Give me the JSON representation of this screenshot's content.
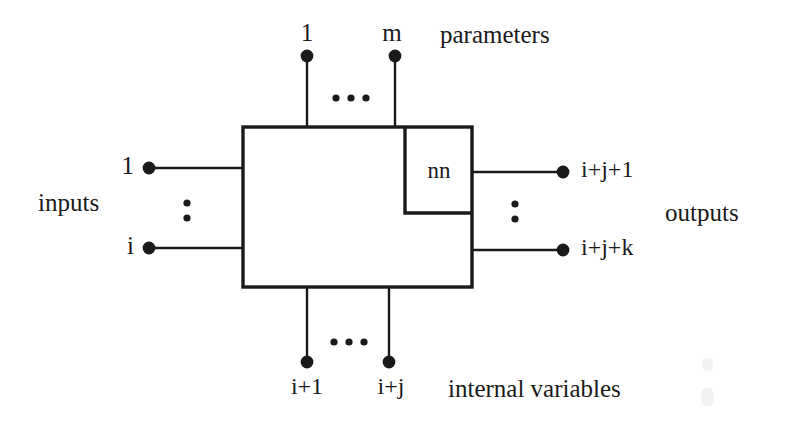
{
  "figure": {
    "type": "block-diagram",
    "background_color": "#ffffff",
    "stroke_color": "#1a1a1a"
  },
  "main_block": {
    "name": "system-block",
    "x": 243,
    "y": 127,
    "width": 229,
    "height": 160
  },
  "sub_block": {
    "name": "nn-block",
    "label": "nn",
    "x": 405,
    "y": 127,
    "width": 67,
    "height": 86
  },
  "groups": {
    "parameters": {
      "label": "parameters",
      "label_x": 440,
      "label_y": 22,
      "ellipsis": "...",
      "ports": [
        {
          "label": "1",
          "x": 307,
          "label_x": 307,
          "label_y": 20,
          "dot_y": 56
        },
        {
          "label": "m",
          "x": 395,
          "label_x": 392,
          "label_y": 20,
          "dot_y": 56
        }
      ]
    },
    "inputs": {
      "label": "inputs",
      "label_x": 38,
      "label_y": 190,
      "ellipsis": ":",
      "ports": [
        {
          "label": "1",
          "y": 168,
          "dot_x": 149,
          "label_x": 127,
          "label_y": 153
        },
        {
          "label": "i",
          "y": 248,
          "dot_x": 149,
          "label_x": 127,
          "label_y": 233
        }
      ]
    },
    "outputs": {
      "label": "outputs",
      "label_x": 665,
      "label_y": 200,
      "ellipsis": ":",
      "ports": [
        {
          "label": "i+j+1",
          "y": 172,
          "dot_x": 563,
          "label_x": 581,
          "label_y": 157
        },
        {
          "label": "i+j+k",
          "y": 250,
          "dot_x": 563,
          "label_x": 581,
          "label_y": 235
        }
      ]
    },
    "internal_variables": {
      "label": "internal variables",
      "label_x": 448,
      "label_y": 376,
      "ellipsis": "...",
      "ports": [
        {
          "label": "i+1",
          "x": 307,
          "label_x": 307,
          "label_y": 374,
          "dot_y": 362
        },
        {
          "label": "i+j",
          "x": 389,
          "label_x": 391,
          "label_y": 374,
          "dot_y": 362
        }
      ]
    }
  }
}
